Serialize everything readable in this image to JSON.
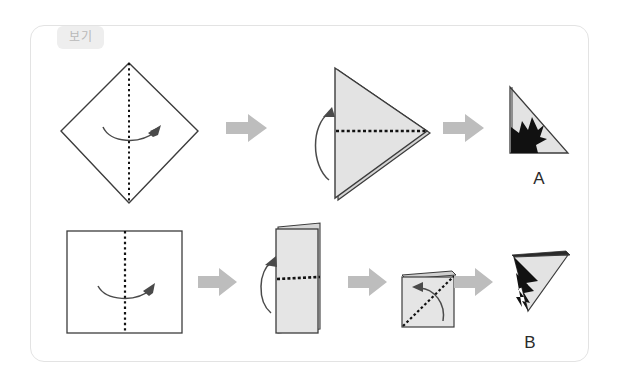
{
  "panel": {
    "badge_label": "보기",
    "border_color": "#e3e3e3",
    "badge_bg": "#eeeeee",
    "badge_text_color": "#b9b9b9",
    "background": "#ffffff"
  },
  "colors": {
    "paper_fill": "#e0e0e0",
    "paper_fill_light": "#ebebeb",
    "paper_stroke": "#3c3c3c",
    "cut_black": "#111111",
    "fold_dotted": "#111111",
    "motion_arrow": "#4a4a4a",
    "step_arrow": "#bdbdbd",
    "label_text": "#2b2b2b"
  },
  "sequences": [
    {
      "id": "A",
      "result_label": "A",
      "steps": [
        {
          "index": 1,
          "name": "diamond-with-vertical-fold",
          "shape": "diamond",
          "fold_line": "vertical-dotted",
          "motion": "curved-arrow-right",
          "fill": "none"
        },
        {
          "index": 2,
          "name": "right-pointing-triangle-with-horizontal-fold",
          "shape": "triangle-right",
          "fold_line": "horizontal-dotted",
          "motion": "curved-arrow-up-left",
          "fill": "gray"
        },
        {
          "index": 3,
          "name": "result-triangle-with-black-cutout",
          "shape": "right-triangle",
          "fold_line": "none",
          "motion": "none",
          "fill": "gray",
          "cutout": "black-jagged-star-bottom-left"
        }
      ],
      "step_arrows": 2
    },
    {
      "id": "B",
      "result_label": "B",
      "steps": [
        {
          "index": 1,
          "name": "square-with-vertical-fold",
          "shape": "square",
          "fold_line": "vertical-dotted",
          "motion": "curved-arrow-right",
          "fill": "none"
        },
        {
          "index": 2,
          "name": "folded-rectangle-with-horizontal-fold",
          "shape": "tall-rectangle",
          "fold_line": "horizontal-dotted",
          "motion": "curved-arrow-up-left",
          "fill": "gray"
        },
        {
          "index": 3,
          "name": "small-square-with-diagonal-fold",
          "shape": "small-square",
          "fold_line": "diagonal-dotted",
          "motion": "curved-arrow-up-left",
          "fill": "gray"
        },
        {
          "index": 4,
          "name": "result-triangle-with-black-cutout",
          "shape": "triangle-down-left",
          "fold_line": "none",
          "motion": "none",
          "fill": "gray",
          "cutout": "black-wedge"
        }
      ],
      "step_arrows": 3
    }
  ]
}
